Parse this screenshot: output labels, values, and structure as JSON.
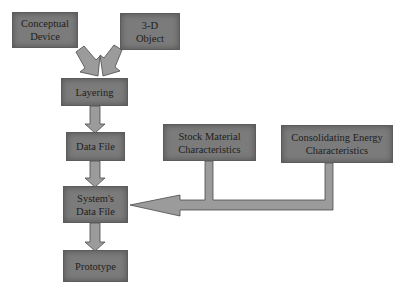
{
  "diagram": {
    "nodes": [
      {
        "id": "conceptual_device",
        "lines": [
          "Conceptual",
          "Device"
        ]
      },
      {
        "id": "object_3d",
        "lines": [
          "3-D",
          "Object"
        ]
      },
      {
        "id": "layering",
        "lines": [
          "Layering"
        ]
      },
      {
        "id": "data_file",
        "lines": [
          "Data File"
        ]
      },
      {
        "id": "systems_data_file",
        "lines": [
          "System's",
          "Data File"
        ]
      },
      {
        "id": "prototype",
        "lines": [
          "Prototype"
        ]
      },
      {
        "id": "stock_material",
        "lines": [
          "Stock Material",
          "Characteristics"
        ]
      },
      {
        "id": "consolidating_energy",
        "lines": [
          "Consolidating Energy",
          "Characteristics"
        ]
      }
    ],
    "edges": [
      {
        "from": "conceptual_device",
        "to": "layering"
      },
      {
        "from": "object_3d",
        "to": "layering"
      },
      {
        "from": "layering",
        "to": "data_file"
      },
      {
        "from": "data_file",
        "to": "systems_data_file"
      },
      {
        "from": "systems_data_file",
        "to": "prototype"
      },
      {
        "from": "stock_material",
        "to": "systems_data_file"
      },
      {
        "from": "consolidating_energy",
        "to": "systems_data_file"
      }
    ],
    "colors": {
      "box_fill": "#7b7b7b",
      "arrow_fill": "#9b9b9b",
      "outline": "#4a4a4a",
      "text": "#1e1e1e"
    }
  }
}
